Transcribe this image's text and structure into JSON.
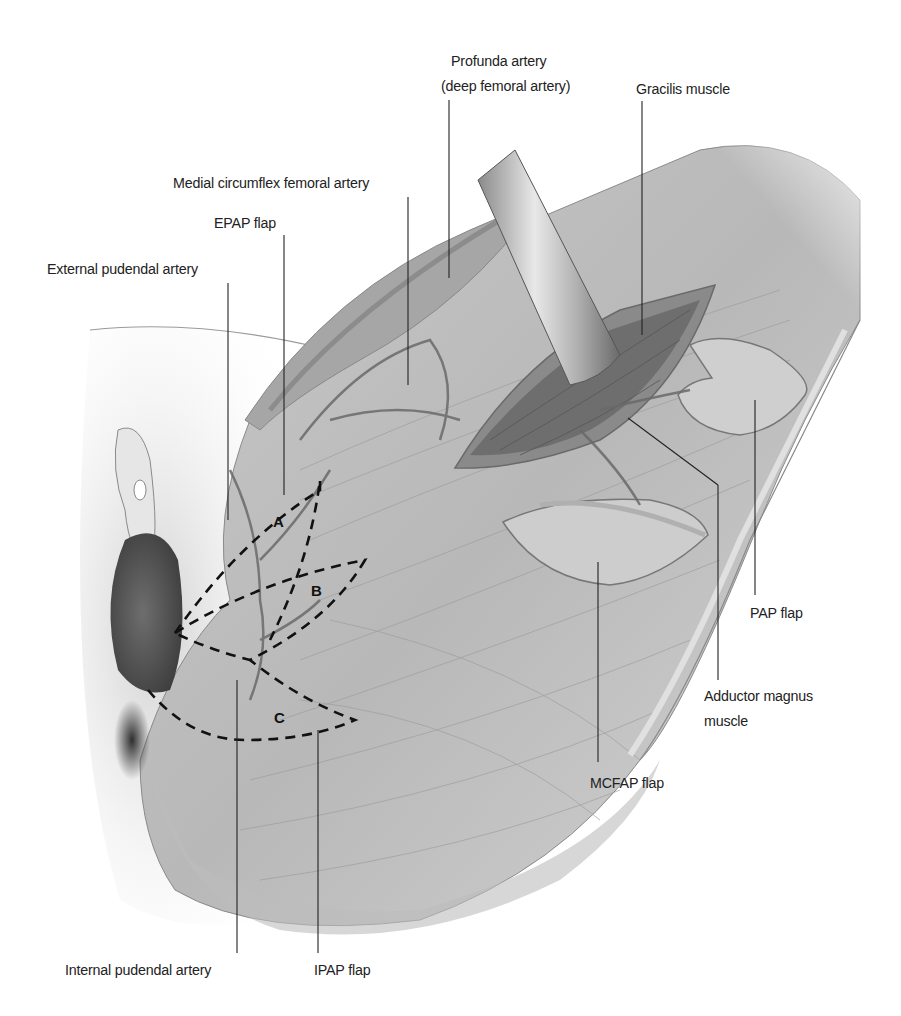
{
  "figure": {
    "colors": {
      "background": "#ffffff",
      "skin": "#d9d9d9",
      "muscle": "#a8a8a8",
      "deep_muscle": "#7a7a7a",
      "scrotum": "#5a5a5a",
      "line": "#222222"
    }
  },
  "labels": {
    "profunda_artery": "Profunda artery",
    "profunda_artery_sub": "(deep femoral artery)",
    "gracilis_muscle": "Gracilis muscle",
    "medial_circumflex": "Medial circumflex femoral artery",
    "epap_flap": "EPAP flap",
    "external_pudendal": "External pudendal artery",
    "pap_flap": "PAP flap",
    "adductor_magnus_1": "Adductor magnus",
    "adductor_magnus_2": "muscle",
    "mcfap_flap": "MCFAP flap",
    "internal_pudendal": "Internal pudendal artery",
    "ipap_flap": "IPAP flap"
  },
  "zones": {
    "a": "A",
    "b": "B",
    "c": "C"
  }
}
